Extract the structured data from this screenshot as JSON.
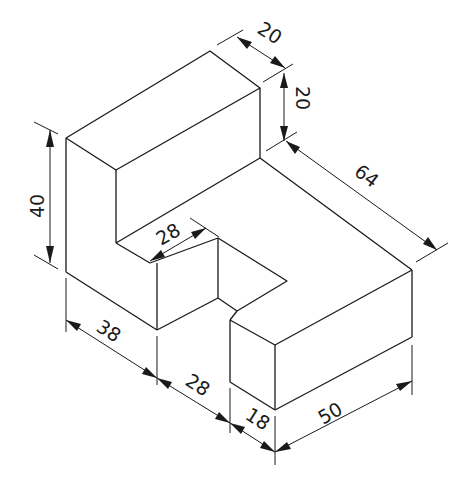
{
  "diagram": {
    "type": "isometric technical drawing",
    "line_color": "#1a1a1a",
    "background": "#ffffff",
    "dimensions": {
      "upright_thickness_top": "20",
      "upright_step_height": "20",
      "overall_depth": "64",
      "overall_height": "40",
      "step_width": "28",
      "left_length": "38",
      "middle_length": "28",
      "front_block_depth": "18",
      "front_block_length": "50"
    }
  }
}
